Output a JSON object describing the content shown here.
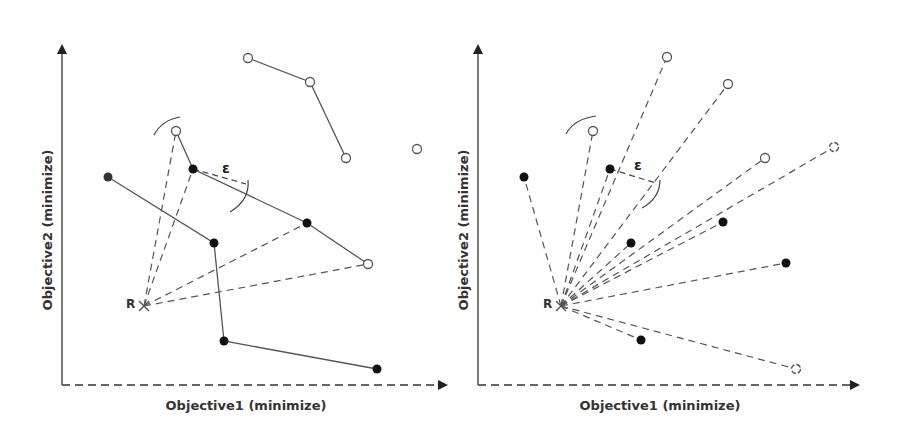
{
  "figure": {
    "colors": {
      "line": "#555555",
      "dash": "#555555",
      "filled_point": "#111111",
      "hollow_point_stroke": "#555555",
      "axis": "#333333",
      "text": "#333333"
    }
  },
  "panels": [
    {
      "name": "left",
      "x_axis_label": "Objective1 (minimize)",
      "y_axis_label": "Objective2 (minimize)",
      "reference_label": "R",
      "epsilon_label": "ε",
      "reference_point": [
        144,
        306
      ],
      "filled_points": [
        [
          108,
          177
        ],
        [
          193,
          169
        ],
        [
          307,
          223
        ],
        [
          214,
          243
        ],
        [
          224,
          341
        ],
        [
          377,
          369
        ]
      ],
      "hollow_points": [
        [
          248,
          58
        ],
        [
          310,
          82
        ],
        [
          346,
          158
        ],
        [
          417,
          149
        ],
        [
          176,
          131
        ],
        [
          368,
          264
        ]
      ],
      "solid_polylines": [
        [
          [
            108,
            177
          ],
          [
            214,
            243
          ],
          [
            224,
            341
          ],
          [
            377,
            369
          ]
        ],
        [
          [
            176,
            131
          ],
          [
            193,
            169
          ],
          [
            307,
            223
          ],
          [
            368,
            264
          ]
        ],
        [
          [
            248,
            58
          ],
          [
            310,
            82
          ],
          [
            346,
            158
          ]
        ]
      ],
      "dashed_rays_to": [
        [
          176,
          131
        ],
        [
          193,
          169
        ],
        [
          307,
          223
        ],
        [
          368,
          264
        ]
      ]
    },
    {
      "name": "right",
      "x_axis_label": "Objective1 (minimize)",
      "y_axis_label": "Objective2 (minimize)",
      "reference_label": "R",
      "epsilon_label": "ε",
      "reference_point": [
        561,
        306
      ],
      "filled_points": [
        [
          524,
          177
        ],
        [
          610,
          169
        ],
        [
          631,
          243
        ],
        [
          723,
          222
        ],
        [
          786,
          263
        ],
        [
          641,
          340
        ]
      ],
      "hollow_points": [
        [
          667,
          57
        ],
        [
          728,
          84
        ],
        [
          593,
          131
        ],
        [
          765,
          158
        ],
        [
          834,
          147
        ],
        [
          796,
          369
        ]
      ],
      "dashed_rays_to": [
        [
          524,
          177
        ],
        [
          593,
          131
        ],
        [
          610,
          169
        ],
        [
          667,
          57
        ],
        [
          728,
          84
        ],
        [
          631,
          243
        ],
        [
          765,
          158
        ],
        [
          723,
          222
        ],
        [
          834,
          147
        ],
        [
          786,
          263
        ],
        [
          641,
          340
        ],
        [
          796,
          369
        ]
      ]
    }
  ]
}
